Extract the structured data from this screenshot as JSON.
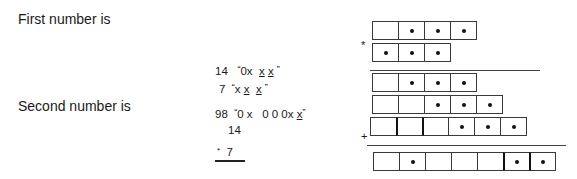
{
  "labels": {
    "first": "First number is",
    "second": "Second number is"
  },
  "calculation": {
    "line1": {
      "num": "14",
      "open": "“",
      "a": "0x",
      "b": "x",
      "c": "x",
      "close": "”"
    },
    "line2": {
      "num": "7",
      "open": "“",
      "a": "x",
      "b": "x",
      "c": "x",
      "close": "”"
    },
    "line3": {
      "num": "98",
      "open": "“",
      "a": "0 x",
      "b": "0 0 0x",
      "c": "x",
      "close": "”"
    },
    "line4": {
      "num": "14"
    },
    "line5": {
      "sign": "*",
      "num": "7"
    }
  },
  "grid": {
    "multiply_sign": "*",
    "plus_sign": "+",
    "rows": [
      {
        "name": "multiplicand",
        "dots": [
          false,
          true,
          true,
          true
        ]
      },
      {
        "name": "multiplier",
        "dots": [
          true,
          true,
          true
        ]
      },
      {
        "name": "partial-product-1",
        "dots": [
          false,
          true,
          true,
          true
        ]
      },
      {
        "name": "partial-product-2",
        "dots": [
          false,
          false,
          true,
          true,
          true
        ]
      },
      {
        "name": "partial-product-3",
        "dots": [
          false,
          false,
          false,
          true,
          true,
          true
        ]
      },
      {
        "name": "result",
        "dots": [
          false,
          true,
          false,
          false,
          false,
          true,
          true
        ]
      }
    ]
  }
}
